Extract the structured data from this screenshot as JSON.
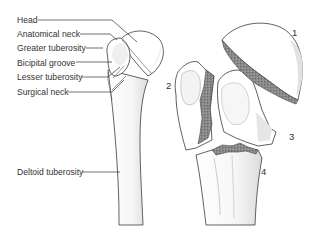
{
  "figure": {
    "left_panel": {
      "subject": "intact proximal humerus",
      "labels": [
        {
          "text": "Head",
          "x": 17,
          "y": 20
        },
        {
          "text": "Anatomical neck",
          "x": 17,
          "y": 36
        },
        {
          "text": "Greater tuberosity",
          "x": 17,
          "y": 49
        },
        {
          "text": "Bicipital groove",
          "x": 17,
          "y": 63
        },
        {
          "text": "Lesser tuberosity",
          "x": 17,
          "y": 77
        },
        {
          "text": "Surgical neck",
          "x": 17,
          "y": 91
        },
        {
          "text": "Deltoid tuberosity",
          "x": 17,
          "y": 174
        }
      ]
    },
    "right_panel": {
      "subject": "four-part fracture of proximal humerus",
      "parts": [
        {
          "number": "1",
          "x": 293,
          "y": 35
        },
        {
          "number": "2",
          "x": 167,
          "y": 86
        },
        {
          "number": "3",
          "x": 289,
          "y": 140
        },
        {
          "number": "4",
          "x": 262,
          "y": 173
        }
      ]
    }
  }
}
